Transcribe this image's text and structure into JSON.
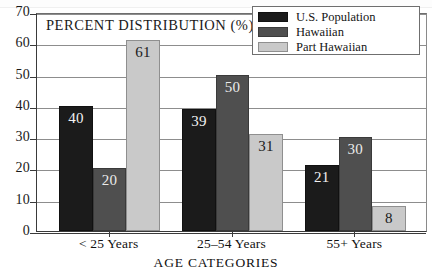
{
  "chart_data": {
    "type": "bar",
    "title": "PERCENT DISTRIBUTION (%)",
    "xlabel": "AGE CATEGORIES",
    "ylabel": "",
    "categories": [
      "< 25 Years",
      "25–54 Years",
      "55+ Years"
    ],
    "series": [
      {
        "name": "U.S. Population",
        "values": [
          40,
          39,
          21
        ],
        "color": "#1b1b1b"
      },
      {
        "name": "Hawaiian",
        "values": [
          20,
          50,
          30
        ],
        "color": "#4f4f4f"
      },
      {
        "name": "Part Hawaiian",
        "values": [
          61,
          31,
          8
        ],
        "color": "#c9c9c9"
      }
    ],
    "ylim": [
      0,
      70
    ],
    "yticks": [
      0,
      10,
      20,
      30,
      40,
      50,
      60,
      70
    ],
    "ytick_labels": [
      "0",
      "10",
      "20",
      "30",
      "40",
      "50",
      "60",
      "70"
    ],
    "grid": true,
    "grid_axis": "y",
    "legend_position": "top-right",
    "data_labels": true
  },
  "legend": {
    "entries": [
      {
        "label": "U.S. Population"
      },
      {
        "label": "Hawaiian"
      },
      {
        "label": "Part Hawaiian"
      }
    ]
  }
}
